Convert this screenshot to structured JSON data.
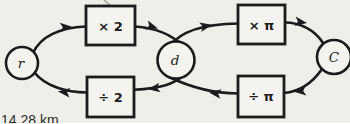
{
  "colors": {
    "background": "#efeeea",
    "ink": "#1c1c1c",
    "box_fill": "#f4f3ef",
    "caption_text": "#2e2e2c"
  },
  "caption": {
    "text": "14.28 km"
  },
  "diagram": {
    "nodes": [
      {
        "id": "r",
        "label": "r"
      },
      {
        "id": "d",
        "label": "d"
      },
      {
        "id": "C",
        "label": "C"
      }
    ],
    "operators": [
      {
        "id": "times-2",
        "label": "× 2"
      },
      {
        "id": "divide-2",
        "label": "÷ 2"
      },
      {
        "id": "times-pi",
        "label": "× π"
      },
      {
        "id": "divide-pi",
        "label": "÷ π"
      }
    ],
    "edges": [
      {
        "from": "r",
        "to": "d",
        "via": "× 2"
      },
      {
        "from": "d",
        "to": "r",
        "via": "÷ 2"
      },
      {
        "from": "d",
        "to": "C",
        "via": "× π"
      },
      {
        "from": "C",
        "to": "d",
        "via": "÷ π"
      }
    ]
  }
}
